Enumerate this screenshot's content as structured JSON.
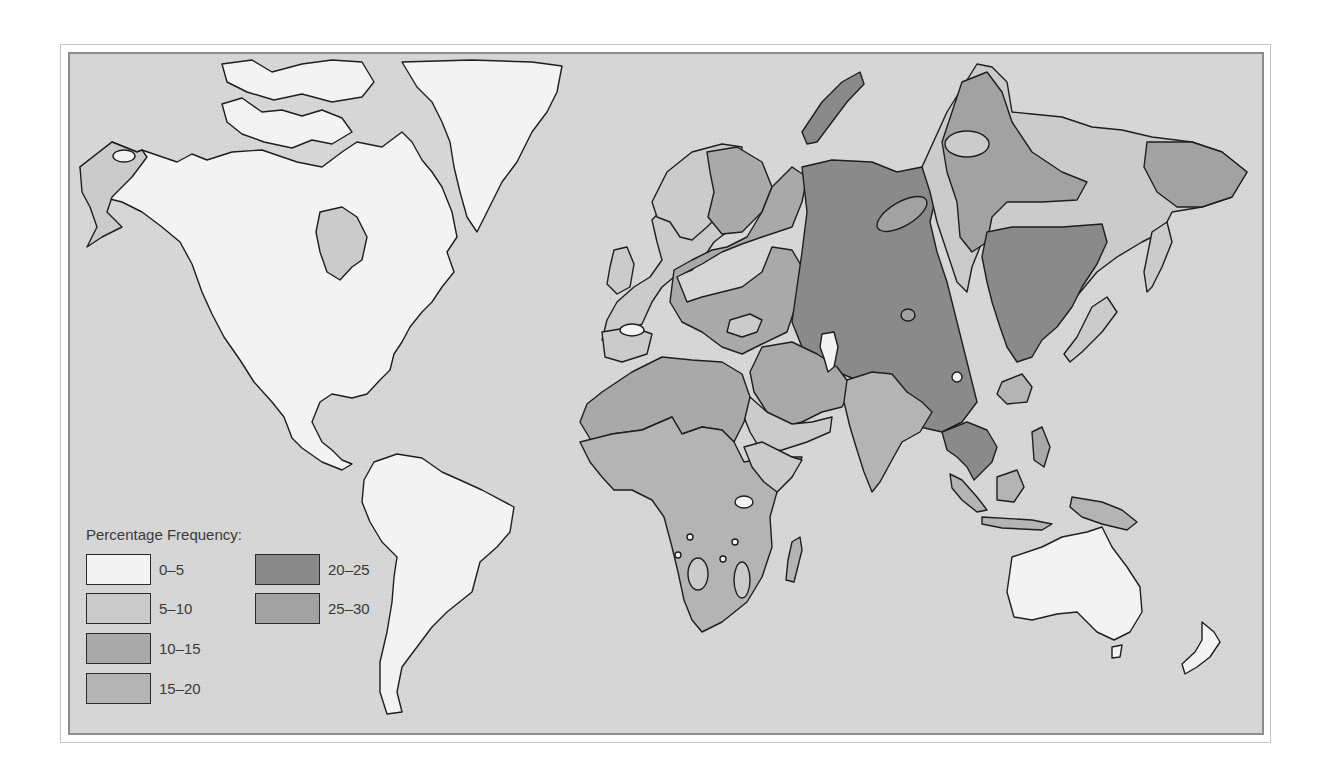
{
  "map": {
    "subject": "World percentage frequency distribution",
    "colors": {
      "ocean": "#d6d6d6",
      "coastline": "#1e1e1e",
      "frame_border": "#8e8e8e"
    }
  },
  "legend": {
    "title": "Percentage Frequency:",
    "items": [
      {
        "label": "0–5",
        "color": "#f3f3f3"
      },
      {
        "label": "5–10",
        "color": "#cbcbcb"
      },
      {
        "label": "10–15",
        "color": "#a9a9a9"
      },
      {
        "label": "15–20",
        "color": "#b4b4b4"
      },
      {
        "label": "20–25",
        "color": "#8a8a8a"
      },
      {
        "label": "25–30",
        "color": "#a2a2a2"
      }
    ]
  },
  "regions": [
    {
      "name": "North America",
      "class": "0–5"
    },
    {
      "name": "Western Alaska",
      "class": "5–10"
    },
    {
      "name": "Hudson Bay area",
      "class": "5–10"
    },
    {
      "name": "Greenland",
      "class": "0–5"
    },
    {
      "name": "South America",
      "class": "0–5"
    },
    {
      "name": "Western Europe",
      "class": "5–10"
    },
    {
      "name": "Eastern Europe",
      "class": "10–15"
    },
    {
      "name": "Central Asia / Western Siberia",
      "class": "20–25"
    },
    {
      "name": "Eastern Siberia",
      "class": "5–10"
    },
    {
      "name": "Northeast China / Mongolia",
      "class": "20–25"
    },
    {
      "name": "North Africa",
      "class": "10–15"
    },
    {
      "name": "Sub-Saharan Africa",
      "class": "15–20"
    },
    {
      "name": "Middle East",
      "class": "10–15"
    },
    {
      "name": "South Asia",
      "class": "15–20"
    },
    {
      "name": "Southeast Asia",
      "class": "20–25"
    },
    {
      "name": "Indonesia / New Guinea",
      "class": "15–20"
    },
    {
      "name": "Australia",
      "class": "0–5"
    },
    {
      "name": "New Zealand",
      "class": "0–5"
    }
  ]
}
